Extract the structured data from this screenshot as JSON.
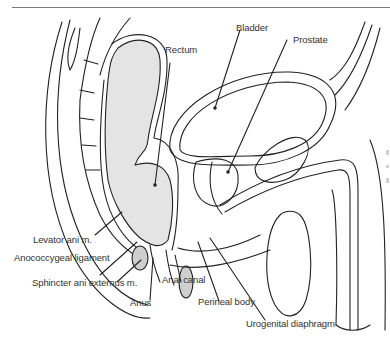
{
  "figure": {
    "labels": {
      "rectum": "Rectum",
      "bladder": "Bladder",
      "prostate": "Prostate",
      "levator_ani": "Levator ani m.",
      "anococcygeal_ligament": "Anococcygeal ligament",
      "sphincter_ani_externus": "Sphincter ani externus m.",
      "anus": "Anus",
      "anal_canal": "Anal canal",
      "perineal_body": "Perineal body",
      "urogenital_diaphragm": "Urogenital diaphragm"
    },
    "colors": {
      "line": "#222222",
      "fill_rectum": "#e4e4e4",
      "label_text": "#333333",
      "rule": "#7a7a7a"
    }
  }
}
